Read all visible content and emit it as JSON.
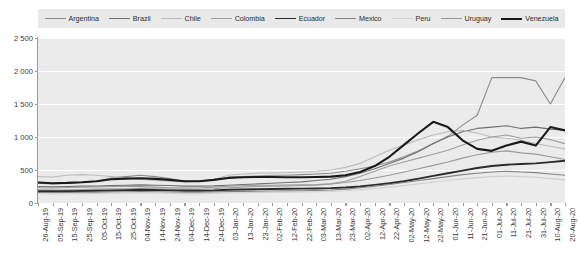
{
  "chart_data": {
    "type": "line",
    "title": "",
    "xlabel": "",
    "ylabel": "",
    "ylim": [
      0,
      2500
    ],
    "yticks": [
      0,
      500,
      1000,
      1500,
      2000,
      2500
    ],
    "ytick_labels": [
      "0",
      "500",
      "1 000",
      "1 500",
      "2 000",
      "2 500"
    ],
    "grid": true,
    "legend_position": "top",
    "x": [
      "26-Aug-19",
      "05-Sep-19",
      "15-Sep-19",
      "25-Sep-19",
      "05-Oct-19",
      "15-Oct-19",
      "25-Oct-19",
      "04-Nov-19",
      "14-Nov-19",
      "24-Nov-19",
      "04-Dec-19",
      "14-Dec-19",
      "24-Dec-19",
      "03-Jan-20",
      "13-Jan-20",
      "23-Jan-20",
      "02-Feb-20",
      "12-Feb-20",
      "22-Feb-20",
      "03-Mar-20",
      "13-Mar-20",
      "23-Mar-20",
      "02-Apr-20",
      "12-Apr-20",
      "22-Apr-20",
      "02-May-20",
      "12-May-20",
      "22-May-20",
      "01-Jun-20",
      "11-Jun-20",
      "21-Jun-20",
      "01-Jul-20",
      "11-Jul-20",
      "21-Jul-20",
      "31-Jul-20",
      "10-Aug-20",
      "20-Aug-20"
    ],
    "series": [
      {
        "name": "Argentina",
        "color": "#8c8c8c",
        "width": 1.1,
        "values": [
          300,
          290,
          300,
          310,
          330,
          380,
          400,
          420,
          400,
          370,
          330,
          330,
          350,
          390,
          400,
          410,
          420,
          420,
          430,
          440,
          450,
          480,
          520,
          560,
          620,
          700,
          790,
          900,
          1010,
          1180,
          1330,
          1900,
          1900,
          1900,
          1850,
          1500,
          1900
        ]
      },
      {
        "name": "Brazil",
        "color": "#707070",
        "width": 1.1,
        "values": [
          250,
          245,
          250,
          255,
          255,
          265,
          270,
          275,
          270,
          265,
          255,
          255,
          260,
          270,
          280,
          290,
          300,
          310,
          320,
          340,
          360,
          400,
          450,
          520,
          600,
          680,
          780,
          900,
          1000,
          1080,
          1130,
          1150,
          1170,
          1130,
          1150,
          1120,
          1100
        ]
      },
      {
        "name": "Chile",
        "color": "#bcbcbc",
        "width": 1.1,
        "values": [
          400,
          395,
          420,
          430,
          420,
          400,
          380,
          360,
          340,
          330,
          320,
          330,
          360,
          420,
          440,
          450,
          455,
          460,
          470,
          480,
          500,
          540,
          600,
          700,
          800,
          880,
          960,
          1030,
          1080,
          1100,
          1060,
          1000,
          980,
          950,
          900,
          860,
          820
        ]
      },
      {
        "name": "Colombia",
        "color": "#9f9f9f",
        "width": 1.1,
        "values": [
          200,
          195,
          200,
          205,
          210,
          215,
          215,
          220,
          215,
          210,
          205,
          205,
          215,
          230,
          240,
          250,
          255,
          260,
          265,
          270,
          290,
          330,
          400,
          480,
          560,
          620,
          680,
          740,
          800,
          880,
          950,
          1000,
          1030,
          980,
          1000,
          960,
          900
        ]
      },
      {
        "name": "Ecuador",
        "color": "#2b2b2b",
        "width": 1.9,
        "values": [
          180,
          178,
          180,
          182,
          185,
          190,
          195,
          200,
          198,
          192,
          186,
          186,
          190,
          200,
          205,
          210,
          212,
          215,
          218,
          220,
          225,
          235,
          250,
          275,
          300,
          330,
          370,
          410,
          450,
          490,
          530,
          560,
          580,
          590,
          600,
          620,
          640
        ]
      },
      {
        "name": "Mexico",
        "color": "#848484",
        "width": 1.1,
        "values": [
          160,
          158,
          160,
          162,
          164,
          168,
          170,
          172,
          170,
          166,
          162,
          162,
          166,
          172,
          176,
          180,
          182,
          184,
          186,
          190,
          196,
          210,
          230,
          255,
          280,
          310,
          340,
          370,
          400,
          430,
          450,
          470,
          480,
          470,
          460,
          440,
          420
        ]
      },
      {
        "name": "Peru",
        "color": "#d0d0d0",
        "width": 1.1,
        "values": [
          140,
          138,
          140,
          142,
          145,
          148,
          150,
          152,
          150,
          146,
          142,
          142,
          146,
          152,
          156,
          160,
          162,
          164,
          166,
          170,
          175,
          185,
          200,
          220,
          240,
          265,
          290,
          315,
          340,
          365,
          385,
          400,
          410,
          400,
          390,
          370,
          350
        ]
      },
      {
        "name": "Uruguay",
        "color": "#999999",
        "width": 1.1,
        "values": [
          230,
          228,
          235,
          240,
          245,
          250,
          250,
          248,
          240,
          232,
          225,
          228,
          240,
          255,
          262,
          268,
          270,
          272,
          275,
          280,
          290,
          310,
          340,
          380,
          420,
          470,
          520,
          570,
          620,
          680,
          730,
          770,
          790,
          760,
          740,
          700,
          660
        ]
      },
      {
        "name": "Venezuela",
        "color": "#1a1a1a",
        "width": 2.1,
        "values": [
          310,
          300,
          305,
          315,
          330,
          360,
          370,
          375,
          365,
          350,
          330,
          330,
          350,
          380,
          390,
          395,
          395,
          390,
          390,
          395,
          400,
          420,
          470,
          560,
          700,
          880,
          1060,
          1230,
          1150,
          950,
          820,
          790,
          870,
          930,
          870,
          1150,
          1100
        ]
      }
    ]
  }
}
